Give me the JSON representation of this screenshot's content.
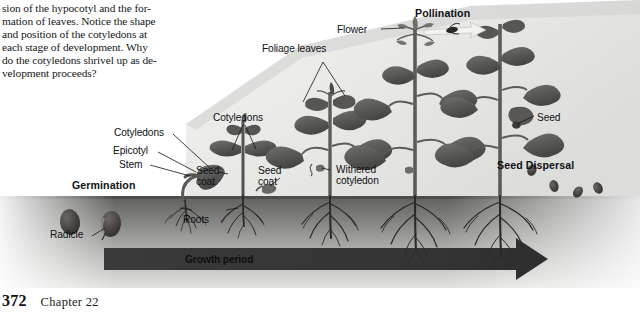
{
  "page": {
    "width": 640,
    "height": 318,
    "background": "#ffffff"
  },
  "body_text": "sion of the hypocotyl and the for-\nmation of leaves. Notice the shape\nand position of the cotyledons at\neach stage of development. Why\ndo the cotyledons shrivel up as de-\nvelopment proceeds?",
  "footer": {
    "page_number": "372",
    "chapter": "Chapter 22"
  },
  "figure": {
    "caption_labels": {
      "germination": "Germination",
      "pollination": "Pollination",
      "seed_dispersal": "Seed Dispersal",
      "growth_period": "Growth period"
    },
    "part_labels": {
      "radicle": "Radicle",
      "epicotyl": "Epicotyl",
      "stem": "Stem",
      "cotyledons_1": "Cotyledons",
      "cotyledons_2": "Cotyledons",
      "seed_coat_1": "Seed\ncoat",
      "seed_coat_2": "Seed\ncoat",
      "roots": "Roots",
      "withered_cotyledon": "Withered\ncotyledon",
      "foliage_leaves": "Foliage leaves",
      "flower": "Flower",
      "seed": "Seed"
    },
    "colors": {
      "sky_backdrop": "#e8e8e6",
      "soil_top": "#6e6e6c",
      "soil_bottom": "#cfcfcd",
      "growth_band": "#3a3a3a",
      "plant_dark": "#4a4a48",
      "plant_mid": "#6b6b68",
      "seed_dark": "#3d3a38",
      "label_text": "#101114"
    },
    "stages": [
      {
        "name": "seed",
        "label": "Radicle"
      },
      {
        "name": "germinating-seedling",
        "label": "Germination"
      },
      {
        "name": "young-seedling",
        "label": "Cotyledons"
      },
      {
        "name": "leafy-plant",
        "label": "Foliage leaves"
      },
      {
        "name": "flowering-plant",
        "label": "Flower"
      },
      {
        "name": "fruiting-plant",
        "label": "Seed"
      }
    ]
  }
}
